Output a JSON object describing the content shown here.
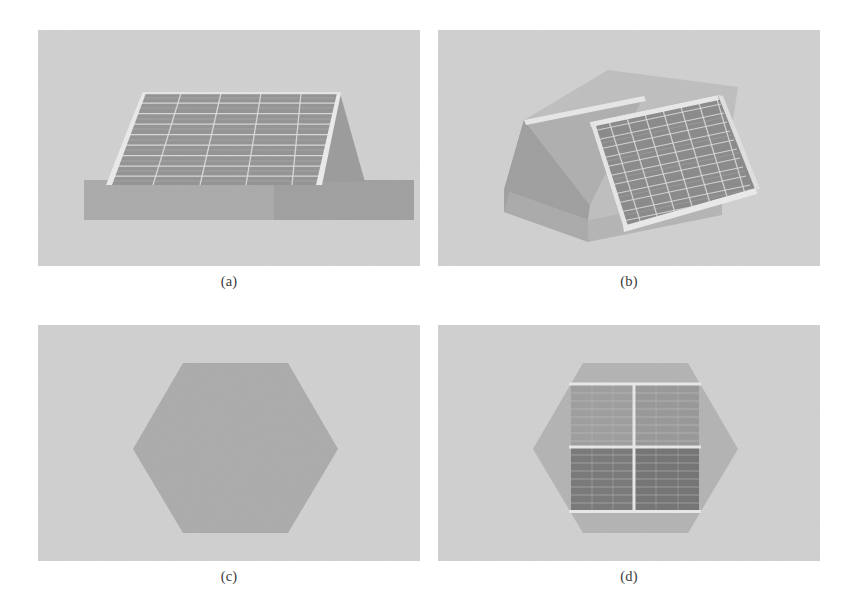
{
  "figure": {
    "layout": "2x2",
    "width": 860,
    "height": 610,
    "background": "#ffffff",
    "panel_width": 382,
    "panel_height": 236
  },
  "palette": {
    "page_background": "#ffffff",
    "panel_background": "#d0d0d0",
    "panel_background_noise": "#c4c4c4",
    "hexagon_base": "#9b9b9b",
    "hexagon_base_light": "#b0b0b0",
    "pedestal_light": "#9a9a9a",
    "pedestal_dark": "#8a8a8a",
    "wedge_face_light": "#bdbdbd",
    "wedge_face_mid": "#a6a6a6",
    "wedge_face_dark": "#8f8f8f",
    "panel_cell_medium": "#8b8b8b",
    "panel_cell_dark": "#6f6f6f",
    "panel_cell_darker": "#5a5a5a",
    "panel_cell_darkest": "#4e4e4e",
    "grid_line": "#e8e8e8",
    "frame_highlight": "#f2f2f2",
    "caption_text": "#3a3a3a"
  },
  "subfigures": [
    {
      "id": "a",
      "caption": "(a)",
      "view": "front-elevation",
      "description": "Front elevation of an inclined solar panel array mounted on a rectangular pedestal base",
      "solar_array": {
        "columns": 5,
        "rows": 9,
        "cell_fill": "#7c7c7c",
        "grid_line": "#e8e8e8",
        "frame_highlight": "#f4f4f4"
      },
      "base": {
        "left_tone": "#9c9c9c",
        "right_tone": "#8d8d8d"
      },
      "side_face": {
        "tone": "#888888"
      }
    },
    {
      "id": "b",
      "caption": "(b)",
      "view": "perspective",
      "description": "Three-quarter perspective view of the tilted solar panel array resting on a wedge-shaped hexagonal base",
      "solar_array": {
        "columns": 7,
        "rows": 11,
        "cell_fill": "#6e6e6e",
        "grid_line": "#dcdcdc",
        "frame_highlight": "#f4f4f4"
      },
      "base": {
        "top_face": "#b8b8b8",
        "front_face": "#a3a3a3",
        "side_face": "#8f8f8f",
        "ramp_face": "#9a9a9a"
      }
    },
    {
      "id": "c",
      "caption": "(c)",
      "view": "top-plan-bare",
      "description": "Plan view of the bare hexagonal base plate with no solar array",
      "hexagon": {
        "fill": "#9d9d9d",
        "orientation": "pointy-left-right",
        "width": 200,
        "height": 176
      }
    },
    {
      "id": "d",
      "caption": "(d)",
      "view": "top-plan-populated",
      "description": "Plan view of the hexagonal base with a 2x2 solar panel array mounted on top",
      "hexagon": {
        "fill": "#a8a8a8",
        "orientation": "pointy-left-right",
        "width": 200,
        "height": 176
      },
      "quadrants": [
        {
          "position": "top-left",
          "fill": "#8a8a8a"
        },
        {
          "position": "top-right",
          "fill": "#828282"
        },
        {
          "position": "bottom-left",
          "fill": "#565656"
        },
        {
          "position": "bottom-right",
          "fill": "#4f4f4f"
        }
      ],
      "divider": {
        "color": "#f0f0f0",
        "thickness": 3
      },
      "sub_grid": {
        "columns": 6,
        "rows": 8,
        "line_color": "#c8c8c8"
      }
    }
  ]
}
